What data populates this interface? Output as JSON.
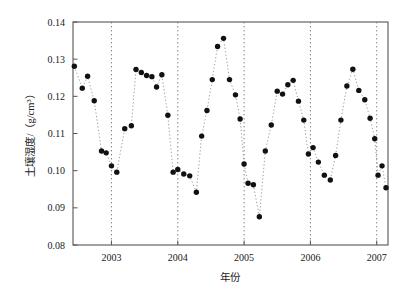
{
  "chart_data": {
    "type": "scatter",
    "title": "",
    "subtitle": "",
    "xlabel": "年份",
    "ylabel": "土壤湿度/（g/cm³）",
    "xlim": [
      2002.42,
      2007.17
    ],
    "ylim": [
      0.08,
      0.14
    ],
    "grid": "vertical-dotted-at-year-ticks",
    "legend": null,
    "marker": "filled-circle",
    "line_style": "dotted",
    "line_color": "#9a9a9a",
    "marker_color": "#111111",
    "xticks": [
      2003,
      2004,
      2005,
      2006,
      2007
    ],
    "xtick_labels": [
      "2003",
      "2004",
      "2005",
      "2006",
      "2007"
    ],
    "yticks": [
      0.08,
      0.09,
      0.1,
      0.11,
      0.12,
      0.13,
      0.14
    ],
    "ytick_labels": [
      "0.08",
      "0.09",
      "0.10",
      "0.11",
      "0.12",
      "0.13",
      "0.14"
    ],
    "series": [
      {
        "name": "土壤湿度",
        "x": [
          2002.44,
          2002.56,
          2002.64,
          2002.74,
          2002.85,
          2002.92,
          2003.0,
          2003.08,
          2003.2,
          2003.3,
          2003.37,
          2003.45,
          2003.53,
          2003.61,
          2003.68,
          2003.76,
          2003.85,
          2003.93,
          2004.0,
          2004.09,
          2004.18,
          2004.28,
          2004.36,
          2004.44,
          2004.52,
          2004.6,
          2004.69,
          2004.78,
          2004.87,
          2004.94,
          2005.0,
          2005.06,
          2005.14,
          2005.23,
          2005.32,
          2005.41,
          2005.5,
          2005.58,
          2005.66,
          2005.74,
          2005.82,
          2005.9,
          2005.97,
          2006.04,
          2006.12,
          2006.21,
          2006.3,
          2006.38,
          2006.46,
          2006.55,
          2006.64,
          2006.73,
          2006.82,
          2006.9,
          2006.97,
          2007.02,
          2007.08,
          2007.14
        ],
        "y": [
          0.1281,
          0.1222,
          0.1254,
          0.1188,
          0.1053,
          0.1048,
          0.1013,
          0.0996,
          0.1113,
          0.1121,
          0.1272,
          0.1264,
          0.1256,
          0.1253,
          0.1225,
          0.1258,
          0.1149,
          0.0996,
          0.1003,
          0.0991,
          0.0986,
          0.0942,
          0.1093,
          0.1162,
          0.1245,
          0.1334,
          0.1356,
          0.1245,
          0.1204,
          0.1139,
          0.1018,
          0.0966,
          0.0962,
          0.0876,
          0.1053,
          0.1123,
          0.1214,
          0.1206,
          0.1231,
          0.1243,
          0.1187,
          0.1136,
          0.1045,
          0.1062,
          0.1023,
          0.0988,
          0.0975,
          0.1041,
          0.1136,
          0.1228,
          0.1273,
          0.1216,
          0.1191,
          0.1141,
          0.1086,
          0.0988,
          0.1013,
          0.0954
        ]
      }
    ]
  },
  "axes": {
    "ylabel": "土壤湿度/（g/cm³）",
    "xlabel": "年份"
  }
}
